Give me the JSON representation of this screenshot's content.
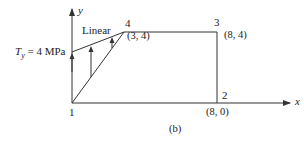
{
  "figure": {
    "caption": "(b)",
    "colors": {
      "line": "#333333",
      "text": "#222222",
      "background": "#ffffff"
    },
    "axes": {
      "x_label": "x",
      "y_label": "y"
    },
    "nodes": [
      {
        "id": "1",
        "label": "1",
        "coord": ""
      },
      {
        "id": "2",
        "label": "2",
        "coord": "(8, 0)"
      },
      {
        "id": "3",
        "label": "3",
        "coord": "(8, 4)"
      },
      {
        "id": "4",
        "label": "4",
        "coord": "(3, 4)"
      }
    ],
    "load": {
      "distribution_label": "Linear",
      "traction_symbol": "T",
      "traction_subscript": "y",
      "traction_value": "= 4 MPa"
    }
  }
}
